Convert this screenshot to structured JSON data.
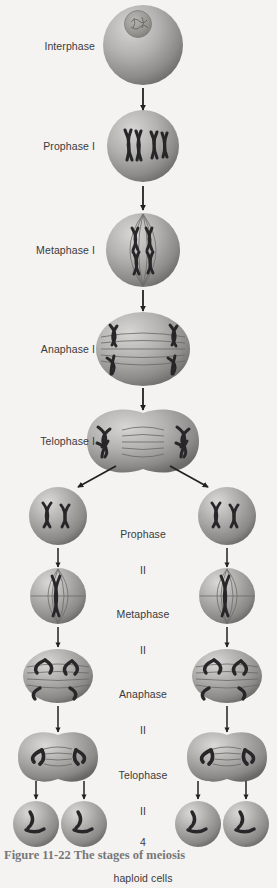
{
  "figure": {
    "caption": "Figure 11-22  The stages of meiosis",
    "background_color": "#f4f3f1",
    "label_color": "#3a3a3c",
    "cell_fill_light": "#c9c7c5",
    "cell_fill_mid": "#9a9896",
    "cell_fill_dark": "#6f6d6c",
    "chromosome_color": "#2d2d2f",
    "spindle_color": "#706e6d",
    "arrow_color": "#222224"
  },
  "labels": {
    "interphase": "Interphase",
    "prophase_1": "Prophase I",
    "metaphase_1": "Metaphase I",
    "anaphase_1": "Anaphase I",
    "telophase_1": "Telophase I",
    "prophase_2_line1": "Prophase",
    "prophase_2_line2": "II",
    "metaphase_2_line1": "Metaphase",
    "metaphase_2_line2": "II",
    "anaphase_2_line1": "Anaphase",
    "anaphase_2_line2": "II",
    "telophase_2_line1": "Telophase",
    "telophase_2_line2": "II",
    "result_line1": "4",
    "result_line2": "haploid cells"
  },
  "stages": [
    {
      "id": "interphase",
      "label": "Interphase",
      "label_position": "left",
      "label_x": 95,
      "label_y": 46,
      "cell_count": 1,
      "cells": [
        {
          "cx": 143,
          "cy": 45,
          "rx": 40,
          "ry": 40
        }
      ],
      "feature": "nucleus"
    },
    {
      "id": "prophase-1",
      "label": "Prophase I",
      "label_position": "left",
      "label_x": 95,
      "label_y": 146,
      "cell_count": 1,
      "cells": [
        {
          "cx": 143,
          "cy": 146,
          "rx": 36,
          "ry": 36
        }
      ],
      "feature": "paired-chromosomes"
    },
    {
      "id": "metaphase-1",
      "label": "Metaphase I",
      "label_position": "left",
      "label_x": 95,
      "label_y": 250,
      "cell_count": 1,
      "cells": [
        {
          "cx": 143,
          "cy": 250,
          "rx": 37,
          "ry": 37
        }
      ],
      "feature": "spindle-aligned"
    },
    {
      "id": "anaphase-1",
      "label": "Anaphase I",
      "label_position": "left",
      "label_x": 95,
      "label_y": 349,
      "cell_count": 1,
      "cells": [
        {
          "cx": 143,
          "cy": 349,
          "rx": 47,
          "ry": 37
        }
      ],
      "feature": "spindle-separating"
    },
    {
      "id": "telophase-1",
      "label": "Telophase I",
      "label_position": "left",
      "label_x": 95,
      "label_y": 441,
      "cell_count": 1,
      "cells": [
        {
          "cx": 143,
          "cy": 441,
          "rx": 56,
          "ry": 30
        }
      ],
      "feature": "cleaving-two-lobes"
    },
    {
      "id": "prophase-2",
      "label": "Prophase\nII",
      "label_position": "center",
      "label_x": 143,
      "label_y": 516,
      "cell_count": 2,
      "cells": [
        {
          "cx": 58,
          "cy": 516,
          "rx": 29,
          "ry": 29
        },
        {
          "cx": 227,
          "cy": 516,
          "rx": 29,
          "ry": 29
        }
      ],
      "feature": "two-chromosomes"
    },
    {
      "id": "metaphase-2",
      "label": "Metaphase\nII",
      "label_position": "center",
      "label_x": 143,
      "label_y": 596,
      "cell_count": 2,
      "cells": [
        {
          "cx": 58,
          "cy": 596,
          "rx": 28,
          "ry": 28
        },
        {
          "cx": 227,
          "cy": 596,
          "rx": 28,
          "ry": 28
        }
      ],
      "feature": "spindle-aligned-small"
    },
    {
      "id": "anaphase-2",
      "label": "Anaphase\nII",
      "label_position": "center",
      "label_x": 143,
      "label_y": 676,
      "cell_count": 2,
      "cells": [
        {
          "cx": 58,
          "cy": 676,
          "rx": 35,
          "ry": 27
        },
        {
          "cx": 227,
          "cy": 676,
          "rx": 35,
          "ry": 27
        }
      ],
      "feature": "spindle-separating-small"
    },
    {
      "id": "telophase-2",
      "label": "Telophase\nII",
      "label_position": "center",
      "label_x": 143,
      "label_y": 757,
      "cell_count": 2,
      "cells": [
        {
          "cx": 58,
          "cy": 757,
          "rx": 40,
          "ry": 22
        },
        {
          "cx": 227,
          "cy": 757,
          "rx": 40,
          "ry": 22
        }
      ],
      "feature": "cleaving-two-lobes-small"
    },
    {
      "id": "haploid-cells",
      "label": "4\nhaploid cells",
      "label_position": "center",
      "label_x": 143,
      "label_y": 824,
      "cell_count": 4,
      "cells": [
        {
          "cx": 36,
          "cy": 824,
          "rx": 23,
          "ry": 23
        },
        {
          "cx": 84,
          "cy": 824,
          "rx": 23,
          "ry": 23
        },
        {
          "cx": 198,
          "cy": 824,
          "rx": 23,
          "ry": 23
        },
        {
          "cx": 246,
          "cy": 824,
          "rx": 23,
          "ry": 23
        }
      ],
      "feature": "single-chromatids"
    }
  ],
  "arrows": [
    {
      "id": "arrow-interphase-to-prophase1",
      "x1": 143,
      "y1": 88,
      "x2": 143,
      "y2": 110
    },
    {
      "id": "arrow-prophase1-to-metaphase1",
      "x1": 143,
      "y1": 186,
      "x2": 143,
      "y2": 210
    },
    {
      "id": "arrow-metaphase1-to-anaphase1",
      "x1": 143,
      "y1": 290,
      "x2": 143,
      "y2": 311
    },
    {
      "id": "arrow-anaphase1-to-telophase1",
      "x1": 143,
      "y1": 388,
      "x2": 143,
      "y2": 410
    },
    {
      "id": "arrow-telophase1-to-prophase2-left",
      "x1": 116,
      "y1": 466,
      "x2": 78,
      "y2": 487
    },
    {
      "id": "arrow-telophase1-to-prophase2-right",
      "x1": 170,
      "y1": 466,
      "x2": 208,
      "y2": 487
    },
    {
      "id": "arrow-prophase2-to-metaphase2-left",
      "x1": 58,
      "y1": 548,
      "x2": 58,
      "y2": 567
    },
    {
      "id": "arrow-prophase2-to-metaphase2-right",
      "x1": 227,
      "y1": 548,
      "x2": 227,
      "y2": 567
    },
    {
      "id": "arrow-metaphase2-to-anaphase2-left",
      "x1": 58,
      "y1": 627,
      "x2": 58,
      "y2": 647
    },
    {
      "id": "arrow-metaphase2-to-anaphase2-right",
      "x1": 227,
      "y1": 627,
      "x2": 227,
      "y2": 647
    },
    {
      "id": "arrow-anaphase2-to-telophase2-left",
      "x1": 58,
      "y1": 706,
      "x2": 58,
      "y2": 732
    },
    {
      "id": "arrow-anaphase2-to-telophase2-right",
      "x1": 227,
      "y1": 706,
      "x2": 227,
      "y2": 732
    },
    {
      "id": "arrow-telophase2-to-haploid-1",
      "x1": 36,
      "y1": 781,
      "x2": 36,
      "y2": 799
    },
    {
      "id": "arrow-telophase2-to-haploid-2",
      "x1": 84,
      "y1": 781,
      "x2": 84,
      "y2": 799
    },
    {
      "id": "arrow-telophase2-to-haploid-3",
      "x1": 198,
      "y1": 781,
      "x2": 198,
      "y2": 799
    },
    {
      "id": "arrow-telophase2-to-haploid-4",
      "x1": 246,
      "y1": 781,
      "x2": 246,
      "y2": 799
    }
  ]
}
